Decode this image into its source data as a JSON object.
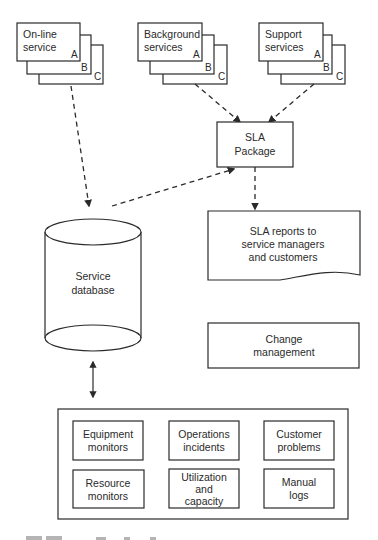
{
  "services": [
    {
      "title_line1": "On-line",
      "title_line2": "service",
      "tags": [
        "A",
        "B",
        "C"
      ]
    },
    {
      "title_line1": "Background",
      "title_line2": "services",
      "tags": [
        "A",
        "B",
        "C"
      ]
    },
    {
      "title_line1": "Support",
      "title_line2": "services",
      "tags": [
        "A",
        "B",
        "C"
      ]
    }
  ],
  "sla_package": {
    "line1": "SLA",
    "line2": "Package"
  },
  "sla_reports": {
    "line1": "SLA reports to",
    "line2": "service managers",
    "line3": "and customers"
  },
  "database": {
    "line1": "Service",
    "line2": "database"
  },
  "change_management": {
    "line1": "Change",
    "line2": "management"
  },
  "sources": [
    {
      "line1": "Equipment",
      "line2": "monitors"
    },
    {
      "line1": "Operations",
      "line2": "incidents"
    },
    {
      "line1": "Customer",
      "line2": "problems"
    },
    {
      "line1": "Resource",
      "line2": "monitors"
    },
    {
      "line1": "Utilization",
      "line2": "and",
      "line3": "capacity"
    },
    {
      "line1": "Manual",
      "line2": "logs"
    }
  ]
}
